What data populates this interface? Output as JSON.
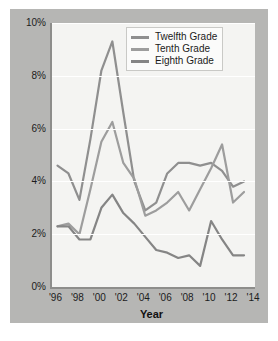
{
  "figure": {
    "panel_bg": "#b6b6b4",
    "plot_bg": "#f4f4f2",
    "axis_color": "#8d8d8b",
    "gridline_color": "#ffffff"
  },
  "axes": {
    "x_title": "Year",
    "y_ticks": [
      "10%",
      "8%",
      "6%",
      "4%",
      "2%",
      "0%"
    ],
    "y_tick_values": [
      10,
      8,
      6,
      4,
      2,
      0
    ],
    "x_ticks": [
      "'96",
      "'98",
      "'00",
      "'02",
      "'04",
      "'06",
      "'08",
      "'10",
      "'12",
      "'14"
    ],
    "x_tick_values": [
      1996,
      1998,
      2000,
      2002,
      2004,
      2006,
      2008,
      2010,
      2012,
      2014
    ]
  },
  "legend": {
    "position": "top-right-inside",
    "items": [
      {
        "label": "Twelfth Grade",
        "color": "#8f8f8f"
      },
      {
        "label": "Tenth Grade",
        "color": "#9d9d9d"
      },
      {
        "label": "Eighth Grade",
        "color": "#858585"
      }
    ]
  },
  "chart_data": {
    "type": "line",
    "title": "",
    "subtitle": "",
    "xlabel": "Year",
    "ylabel": "",
    "xlim": [
      1995.5,
      2014
    ],
    "ylim": [
      0,
      10
    ],
    "grid": true,
    "legend_position": "upper right",
    "x": [
      1996,
      1997,
      1998,
      1999,
      2000,
      2001,
      2002,
      2003,
      2004,
      2005,
      2006,
      2007,
      2008,
      2009,
      2010,
      2011,
      2012,
      2013
    ],
    "series": [
      {
        "name": "Twelfth Grade",
        "color": "#8f8f8f",
        "values": [
          4.6,
          4.3,
          3.3,
          5.6,
          8.2,
          9.3,
          6.6,
          4.0,
          2.9,
          3.2,
          4.3,
          4.7,
          4.7,
          4.6,
          4.7,
          4.4,
          3.8,
          4.0
        ]
      },
      {
        "name": "Tenth Grade",
        "color": "#9d9d9d",
        "values": [
          2.3,
          2.4,
          2.0,
          3.7,
          5.5,
          6.25,
          4.7,
          4.1,
          2.7,
          2.9,
          3.2,
          3.6,
          2.9,
          3.7,
          4.5,
          5.4,
          3.2,
          3.6
        ]
      },
      {
        "name": "Eighth Grade",
        "color": "#858585",
        "values": [
          2.3,
          2.3,
          1.8,
          1.8,
          3.0,
          3.5,
          2.8,
          2.4,
          1.9,
          1.4,
          1.3,
          1.1,
          1.2,
          0.8,
          2.5,
          1.8,
          1.2,
          1.2
        ]
      }
    ]
  }
}
